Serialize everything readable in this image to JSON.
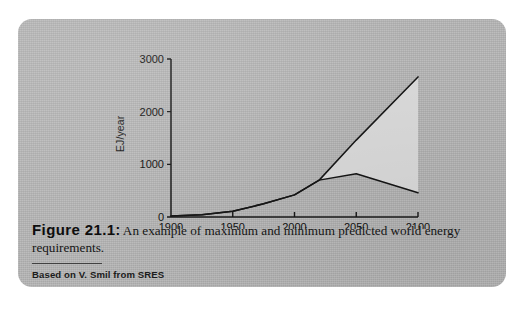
{
  "figure": {
    "number_label": "Figure 21.1",
    "colon": ":",
    "caption_text": "An example of maximum and minimum predicted world energy requirements.",
    "source_note": "Based on V. Smil from SRES"
  },
  "colors": {
    "card_background": "#b6b6b6",
    "page_background": "#ffffff",
    "band_fill": "#d9d9d9",
    "curve_stroke": "#151515",
    "axis_stroke": "#181818",
    "text": "#121212"
  },
  "chart_data": {
    "type": "area",
    "title": "",
    "xlabel": "",
    "ylabel": "EJ/year",
    "xlim": [
      1900,
      2100
    ],
    "ylim": [
      0,
      3000
    ],
    "xticks": [
      1900,
      1950,
      2000,
      2050,
      2100
    ],
    "xticklabels": [
      "1900",
      "1950",
      "2000",
      "2050",
      "2100"
    ],
    "yticks": [
      0,
      1000,
      2000,
      3000
    ],
    "yticklabels": [
      "0",
      "1000",
      "2000",
      "3000"
    ],
    "grid": false,
    "legend": false,
    "legend_position": "none",
    "x": [
      1900,
      1925,
      1950,
      1975,
      2000,
      2020,
      2050,
      2100
    ],
    "series": [
      {
        "name": "Maximum predicted world energy requirement",
        "values": [
          20,
          45,
          110,
          250,
          420,
          700,
          1460,
          2660
        ]
      },
      {
        "name": "Minimum predicted world energy requirement",
        "values": [
          20,
          45,
          110,
          250,
          420,
          700,
          820,
          460
        ]
      }
    ],
    "band": {
      "fill": "#d9d9d9",
      "between": [
        "Maximum predicted world energy requirement",
        "Minimum predicted world energy requirement"
      ],
      "note": "shaded envelope between the maximum and minimum projections after divergence (~2020)"
    },
    "annotations": []
  }
}
